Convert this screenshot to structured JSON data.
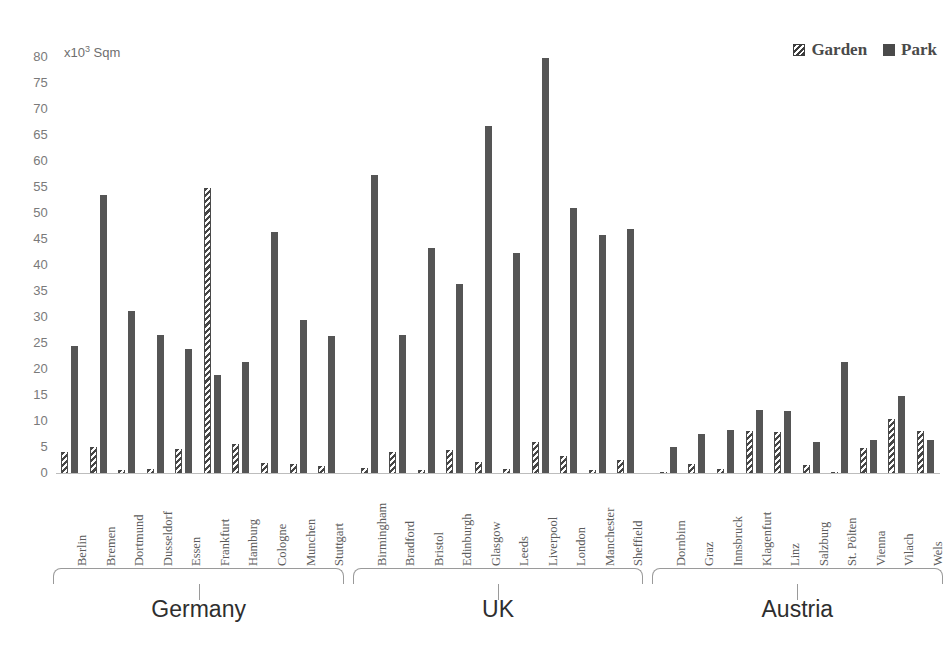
{
  "chart_data": {
    "type": "bar",
    "title": "",
    "subtitle": "",
    "xlabel": "",
    "ylabel": "x10³ Sqm",
    "ylim": [
      0,
      80
    ],
    "ytick_step": 5,
    "yticks": [
      80,
      75,
      70,
      65,
      60,
      55,
      50,
      45,
      40,
      35,
      30,
      25,
      20,
      15,
      10,
      5,
      0
    ],
    "grid": false,
    "legend_position": "top-right",
    "legend": [
      "Garden",
      "Park"
    ],
    "series": [
      {
        "name": "Garden",
        "values": [
          4.2,
          5.2,
          0.7,
          0.9,
          4.8,
          55.0,
          5.8,
          2.2,
          2.0,
          1.6,
          1.2,
          4.2,
          0.8,
          4.6,
          2.4,
          0.9,
          6.2,
          3.5,
          0.8,
          2.7,
          0.4,
          2.0,
          0.9,
          8.3,
          8.0,
          1.7,
          0.3,
          5.0,
          10.5,
          8.2
        ]
      },
      {
        "name": "Park",
        "values": [
          24.6,
          53.6,
          31.4,
          26.7,
          24.1,
          19.0,
          21.6,
          46.6,
          29.6,
          26.6,
          57.5,
          26.7,
          43.5,
          36.6,
          67.0,
          42.5,
          80.0,
          51.2,
          45.9,
          47.2,
          5.2,
          7.6,
          8.4,
          12.4,
          12.2,
          6.1,
          21.5,
          6.6,
          15.0,
          6.6
        ]
      }
    ],
    "categories": [
      "Berlin",
      "Bremen",
      "Dortmund",
      "Dusseldorf",
      "Essen",
      "Frankfurt",
      "Hamburg",
      "Cologne",
      "Munchen",
      "Stuttgart",
      "Birmingham",
      "Bradford",
      "Bristol",
      "Edinburgh",
      "Glasgow",
      "Leeds",
      "Liverpool",
      "London",
      "Manchester",
      "Sheffield",
      "Dornbirn",
      "Graz",
      "Innsbruck",
      "Klagenfurt",
      "Linz",
      "Salzburg",
      "St. Pölten",
      "Vienna",
      "Vilach",
      "Wels"
    ],
    "groups": [
      {
        "label": "Germany",
        "start": 0,
        "count": 10
      },
      {
        "label": "UK",
        "start": 10,
        "count": 10
      },
      {
        "label": "Austria",
        "start": 20,
        "count": 10
      }
    ],
    "colors": {
      "park": "#555555",
      "garden": "#454545",
      "axis_text": "#7a7a7a",
      "baseline": "#bdbdbd",
      "group_label": "#2e2e2e"
    }
  }
}
